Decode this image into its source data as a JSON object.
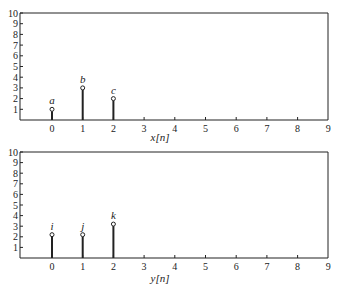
{
  "chart_data": [
    {
      "type": "stem",
      "title": "",
      "xlabel": "x[n]",
      "ylabel": "",
      "xlim": [
        -1,
        9
      ],
      "ylim": [
        0,
        10
      ],
      "x_ticks": [
        0,
        1,
        2,
        3,
        4,
        5,
        6,
        7,
        8,
        9
      ],
      "y_ticks": [
        1,
        2,
        3,
        4,
        5,
        6,
        7,
        8,
        9,
        10
      ],
      "grid": false,
      "points": [
        {
          "x": 0,
          "y": 1,
          "label": "a"
        },
        {
          "x": 1,
          "y": 3,
          "label": "b"
        },
        {
          "x": 2,
          "y": 2,
          "label": "c"
        }
      ]
    },
    {
      "type": "stem",
      "title": "",
      "xlabel": "y[n]",
      "ylabel": "",
      "xlim": [
        -1,
        9
      ],
      "ylim": [
        0,
        10
      ],
      "x_ticks": [
        0,
        1,
        2,
        3,
        4,
        5,
        6,
        7,
        8,
        9
      ],
      "y_ticks": [
        1,
        2,
        3,
        4,
        5,
        6,
        7,
        8,
        9,
        10
      ],
      "grid": false,
      "points": [
        {
          "x": 0,
          "y": 2.2,
          "label": "i"
        },
        {
          "x": 1,
          "y": 2.2,
          "label": "j"
        },
        {
          "x": 2,
          "y": 3.2,
          "label": "k"
        }
      ]
    }
  ],
  "plots": [
    {
      "xlabel": "x[n]"
    },
    {
      "xlabel": "y[n]"
    }
  ],
  "colors": {
    "ink": "#222222",
    "background": "#ffffff"
  }
}
